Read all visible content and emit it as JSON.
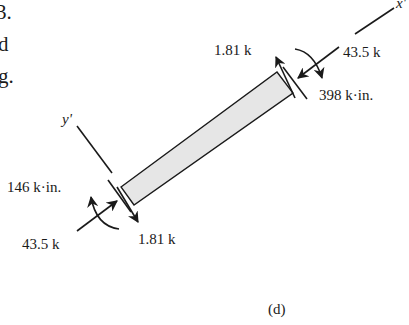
{
  "partial_text": {
    "lines": [
      "3.",
      "d",
      "g."
    ]
  },
  "diagram": {
    "axis_x_label": "x'",
    "axis_y_label": "y'",
    "right_end": {
      "shear": "1.81 k",
      "axial": "43.5 k",
      "moment": "398 k·in."
    },
    "left_end": {
      "moment": "146 k·in.",
      "axial": "43.5 k",
      "shear": "1.81 k"
    },
    "caption": "(d)",
    "colors": {
      "ink": "#1a1a1a",
      "beam_fill": "#e6e6e6",
      "background": "#ffffff"
    }
  }
}
